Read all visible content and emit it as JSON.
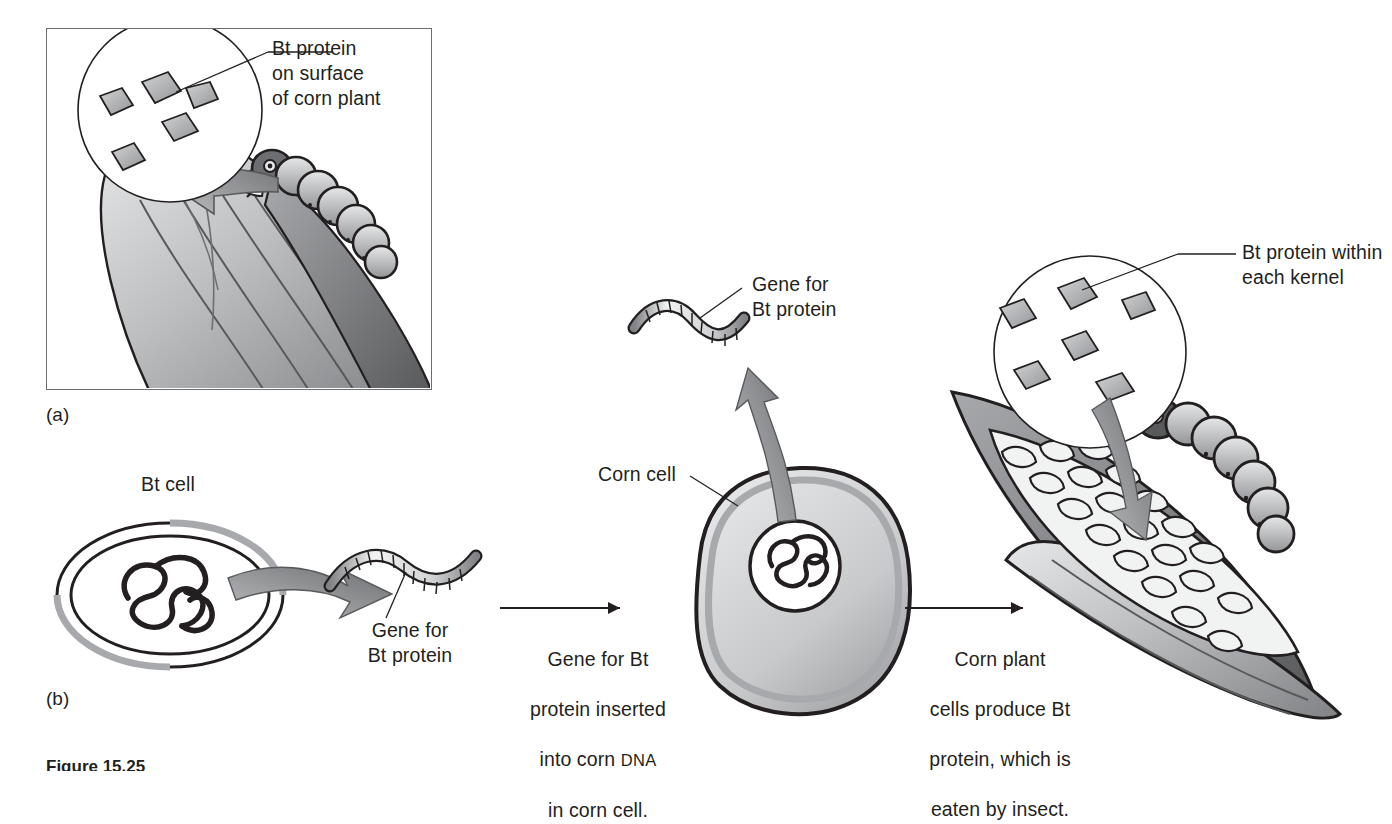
{
  "figure": {
    "caption_clipped": "Figure 15.25",
    "panels": [
      {
        "tag": "(a)",
        "name": "bt-protein-on-surface"
      },
      {
        "tag": "(b)",
        "name": "bt-gene-transfer-process"
      }
    ]
  },
  "panel_a": {
    "tag": "(a)",
    "callout_label": "Bt protein\non surface\nof corn plant",
    "magnifier": {
      "protein_count": 5,
      "shape": "diamond"
    },
    "organism": "corn-ear-with-caterpillar"
  },
  "panel_b": {
    "tag": "(b)",
    "labels": {
      "bt_cell": "Bt cell",
      "gene_for_bt_protein_1": "Gene for\nBt protein",
      "gene_for_bt_protein_2": "Gene for\nBt protein",
      "corn_cell": "Corn cell",
      "kernel_callout": "Bt protein within\neach kernel"
    },
    "steps": [
      {
        "index": 1,
        "arrow": "right-arrow",
        "text_lines": [
          "Gene for Bt",
          "protein inserted",
          "into corn ",
          "in corn cell."
        ],
        "text_plain": "Gene for Bt protein inserted into corn DNA in corn cell.",
        "smallcaps_token": "DNA"
      },
      {
        "index": 2,
        "arrow": "right-arrow",
        "text_lines": [
          "Corn plant",
          "cells produce Bt",
          "protein, which is",
          "eaten by insect."
        ],
        "text_plain": "Corn plant cells produce Bt protein, which is eaten by insect."
      }
    ],
    "magnifier": {
      "protein_count": 6,
      "shape": "diamond"
    }
  },
  "colors": {
    "ink": "#231f20",
    "frame": "#6d6e71",
    "plant_light": "#d9dadb",
    "plant_mid": "#a7a9ac",
    "plant_dark": "#808285",
    "plant_shadow": "#58595b",
    "protein_fill": "#a7a9ac",
    "arrow_gray": "#808285",
    "kernel_fill": "#f1f2f2"
  }
}
